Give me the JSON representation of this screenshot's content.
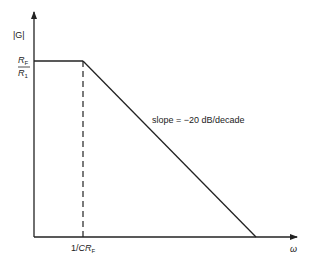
{
  "diagram": {
    "y_axis_label": "|G|",
    "x_axis_label": "ω",
    "gain_label": {
      "numerator": "R",
      "numerator_sub": "F",
      "denominator": "R",
      "denominator_sub": "1"
    },
    "corner_label": {
      "prefix": "1/",
      "var": "CR",
      "sub": "F"
    },
    "slope_label": "slope = −20  dB/decade"
  }
}
